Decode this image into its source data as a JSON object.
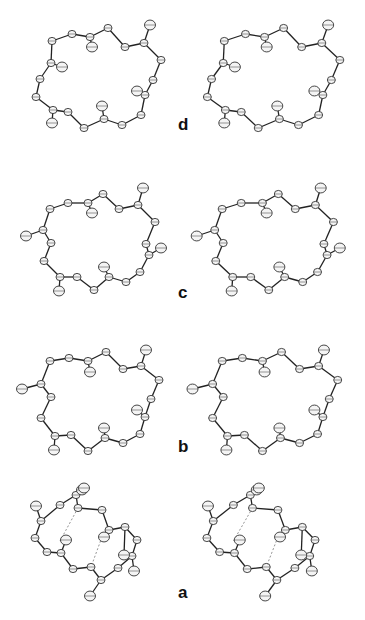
{
  "figure": {
    "panels": [
      {
        "label": "d",
        "ring": [
          [
            52,
            41
          ],
          [
            72,
            34
          ],
          [
            90,
            37
          ],
          [
            108,
            28
          ],
          [
            125,
            47
          ],
          [
            144,
            43
          ],
          [
            161,
            60
          ],
          [
            153,
            80
          ],
          [
            145,
            95
          ],
          [
            141,
            115
          ],
          [
            122,
            125
          ],
          [
            104,
            119
          ],
          [
            84,
            128
          ],
          [
            68,
            112
          ],
          [
            53,
            110
          ],
          [
            36,
            97
          ],
          [
            40,
            79
          ],
          [
            51,
            63
          ]
        ],
        "substituents": [
          [
            [
              144,
              43
            ],
            [
              150,
              25
            ]
          ],
          [
            [
              90,
              37
            ],
            [
              92,
              47
            ]
          ],
          [
            [
              51,
              63
            ],
            [
              62,
              67
            ]
          ],
          [
            [
              145,
              95
            ],
            [
              137,
              91
            ]
          ],
          [
            [
              104,
              119
            ],
            [
              102,
              106
            ]
          ],
          [
            [
              53,
              110
            ],
            [
              52,
              123
            ]
          ]
        ],
        "hbonds": []
      },
      {
        "label": "c",
        "ring": [
          [
            50,
            209
          ],
          [
            68,
            203
          ],
          [
            88,
            203
          ],
          [
            103,
            194
          ],
          [
            119,
            209
          ],
          [
            138,
            205
          ],
          [
            155,
            222
          ],
          [
            146,
            244
          ],
          [
            149,
            255
          ],
          [
            140,
            272
          ],
          [
            126,
            282
          ],
          [
            109,
            277
          ],
          [
            94,
            290
          ],
          [
            77,
            277
          ],
          [
            60,
            277
          ],
          [
            44,
            261
          ],
          [
            51,
            243
          ],
          [
            43,
            230
          ]
        ],
        "substituents": [
          [
            [
              138,
              205
            ],
            [
              143,
              188
            ]
          ],
          [
            [
              88,
              203
            ],
            [
              92,
              213
            ]
          ],
          [
            [
              43,
              230
            ],
            [
              26,
              236
            ]
          ],
          [
            [
              149,
              255
            ],
            [
              161,
              248
            ]
          ],
          [
            [
              109,
              277
            ],
            [
              104,
              267
            ]
          ],
          [
            [
              60,
              277
            ],
            [
              59,
              291
            ]
          ]
        ],
        "hbonds": []
      },
      {
        "label": "b",
        "ring": [
          [
            50,
            361
          ],
          [
            69,
            358
          ],
          [
            88,
            361
          ],
          [
            106,
            352
          ],
          [
            123,
            369
          ],
          [
            141,
            366
          ],
          [
            159,
            380
          ],
          [
            151,
            399
          ],
          [
            145,
            417
          ],
          [
            140,
            434
          ],
          [
            123,
            443
          ],
          [
            105,
            438
          ],
          [
            88,
            451
          ],
          [
            71,
            435
          ],
          [
            55,
            436
          ],
          [
            41,
            418
          ],
          [
            51,
            397
          ],
          [
            41,
            384
          ]
        ],
        "substituents": [
          [
            [
              141,
              366
            ],
            [
              146,
              350
            ]
          ],
          [
            [
              88,
              361
            ],
            [
              90,
              372
            ]
          ],
          [
            [
              41,
              384
            ],
            [
              22,
              389
            ]
          ],
          [
            [
              145,
              417
            ],
            [
              137,
              410
            ]
          ],
          [
            [
              105,
              438
            ],
            [
              104,
              428
            ]
          ],
          [
            [
              55,
              436
            ],
            [
              54,
              450
            ]
          ]
        ],
        "hbonds": []
      },
      {
        "label": "a",
        "ring": [
          [
            60,
            505
          ],
          [
            76,
            495
          ],
          [
            78,
            508
          ],
          [
            102,
            510
          ],
          [
            109,
            530
          ],
          [
            125,
            527
          ],
          [
            137,
            540
          ],
          [
            132,
            556
          ],
          [
            118,
            568
          ],
          [
            101,
            580
          ],
          [
            91,
            567
          ],
          [
            73,
            569
          ],
          [
            61,
            553
          ],
          [
            47,
            552
          ],
          [
            35,
            538
          ],
          [
            41,
            521
          ]
        ],
        "substituents": [
          [
            [
              76,
              495
            ],
            [
              82,
              490
            ]
          ],
          [
            [
              76,
              495
            ],
            [
              84,
              488
            ]
          ],
          [
            [
              41,
              521
            ],
            [
              36,
              506
            ]
          ],
          [
            [
              61,
              553
            ],
            [
              66,
              540
            ]
          ],
          [
            [
              109,
              530
            ],
            [
              104,
              537
            ]
          ],
          [
            [
              132,
              556
            ],
            [
              134,
              571
            ]
          ],
          [
            [
              101,
              580
            ],
            [
              90,
              596
            ]
          ],
          [
            [
              125,
              527
            ],
            [
              124,
              555
            ]
          ]
        ],
        "hbonds": [
          [
            [
              78,
              508
            ],
            [
              60,
              541
            ]
          ],
          [
            [
              102,
              537
            ],
            [
              91,
              567
            ]
          ]
        ]
      }
    ],
    "stereo_offset_note": "Right image of each pair is a stereo view of the left"
  }
}
